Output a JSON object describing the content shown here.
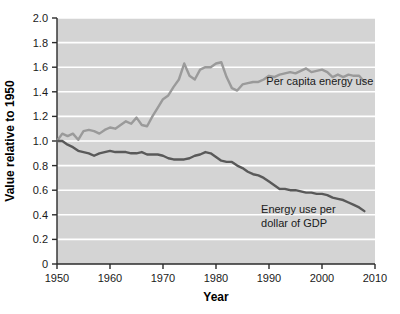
{
  "chart_data": {
    "type": "line",
    "title": "",
    "xlabel": "Year",
    "ylabel": "Value relative to 1950",
    "xlim": [
      1950,
      2010
    ],
    "ylim": [
      0,
      2.0
    ],
    "grid": true,
    "grid_axis": "y",
    "legend_position": "inline-annotations",
    "plot_background": "#d4d4d4",
    "gridline_color": "#ffffff",
    "xticks": [
      1950,
      1960,
      1970,
      1980,
      1990,
      2000,
      2010
    ],
    "xtick_labels": [
      "1950",
      "1960",
      "1970",
      "1980",
      "1990",
      "2000",
      "2010"
    ],
    "yticks": [
      0,
      0.2,
      0.4,
      0.6,
      0.8,
      1.0,
      1.2,
      1.4,
      1.6,
      1.8,
      2.0
    ],
    "ytick_labels": [
      "0",
      "0.2",
      "0.4",
      "0.6",
      "0.8",
      "1.0",
      "1.2",
      "1.4",
      "1.6",
      "1.8",
      "2.0"
    ],
    "x": [
      1950,
      1951,
      1952,
      1953,
      1954,
      1955,
      1956,
      1957,
      1958,
      1959,
      1960,
      1961,
      1962,
      1963,
      1964,
      1965,
      1966,
      1967,
      1968,
      1969,
      1970,
      1971,
      1972,
      1973,
      1974,
      1975,
      1976,
      1977,
      1978,
      1979,
      1980,
      1981,
      1982,
      1983,
      1984,
      1985,
      1986,
      1987,
      1988,
      1989,
      1990,
      1991,
      1992,
      1993,
      1994,
      1995,
      1996,
      1997,
      1998,
      1999,
      2000,
      2001,
      2002,
      2003,
      2004,
      2005,
      2006,
      2007,
      2008
    ],
    "series": [
      {
        "name": "Per capita energy use",
        "color": "#9a9a9a",
        "label_text": "Per capita energy use",
        "label_x": 1989.5,
        "label_y": 1.455,
        "values": [
          1.0,
          1.06,
          1.04,
          1.06,
          1.01,
          1.08,
          1.09,
          1.08,
          1.06,
          1.09,
          1.11,
          1.1,
          1.13,
          1.16,
          1.14,
          1.19,
          1.13,
          1.12,
          1.2,
          1.27,
          1.34,
          1.37,
          1.44,
          1.5,
          1.63,
          1.53,
          1.5,
          1.58,
          1.6,
          1.6,
          1.63,
          1.64,
          1.52,
          1.43,
          1.41,
          1.46,
          1.47,
          1.48,
          1.48,
          1.5,
          1.53,
          1.52,
          1.54,
          1.55,
          1.56,
          1.55,
          1.57,
          1.59,
          1.56,
          1.57,
          1.58,
          1.56,
          1.52,
          1.54,
          1.52,
          1.54,
          1.53,
          1.53,
          1.48
        ]
      },
      {
        "name": "Energy use per dollar of GDP",
        "color": "#595959",
        "label_line1": "Energy use per",
        "label_line2": "dollar of GDP",
        "label_x": 1988.5,
        "label_y": 0.415,
        "values": [
          1.0,
          1.0,
          0.97,
          0.95,
          0.92,
          0.91,
          0.9,
          0.88,
          0.9,
          0.91,
          0.92,
          0.91,
          0.91,
          0.91,
          0.9,
          0.9,
          0.91,
          0.89,
          0.89,
          0.89,
          0.88,
          0.86,
          0.85,
          0.85,
          0.85,
          0.86,
          0.88,
          0.89,
          0.91,
          0.9,
          0.87,
          0.84,
          0.83,
          0.83,
          0.8,
          0.78,
          0.75,
          0.73,
          0.72,
          0.7,
          0.67,
          0.64,
          0.61,
          0.61,
          0.6,
          0.6,
          0.59,
          0.58,
          0.58,
          0.57,
          0.57,
          0.56,
          0.54,
          0.53,
          0.52,
          0.5,
          0.48,
          0.46,
          0.43
        ]
      }
    ]
  }
}
